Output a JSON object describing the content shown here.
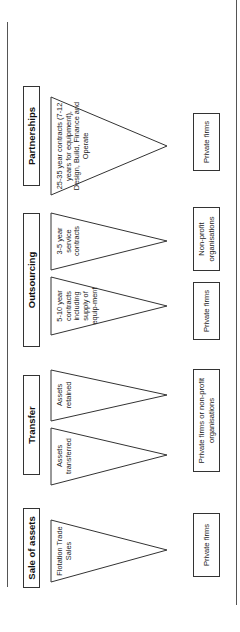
{
  "categories": [
    {
      "id": "partnerships",
      "header": "Partnerships",
      "options": [
        {
          "label": "25-35 year contracts (7-12 years for equipment), Design, Build, Finance and Operate"
        }
      ],
      "providers": [
        {
          "label": "Private firms"
        }
      ]
    },
    {
      "id": "outsourcing",
      "header": "Outsourcing",
      "options": [
        {
          "label": "3-5 year service contracts"
        },
        {
          "label": "5-10 year contracts including supply of equip-ment"
        }
      ],
      "providers": [
        {
          "label": "Non-profit organisations"
        },
        {
          "label": "Private firms"
        }
      ]
    },
    {
      "id": "transfer",
      "header": "Transfer",
      "options": [
        {
          "label": "Assets retained"
        },
        {
          "label": "Assets transferred"
        }
      ],
      "providers": [
        {
          "label": "Private firms or non-profit organisations"
        }
      ]
    },
    {
      "id": "sale-of-assets",
      "header": "Sale of assets",
      "options": [
        {
          "label": "Flotation Trade Sales"
        }
      ],
      "providers": [
        {
          "label": "Private firms"
        }
      ]
    }
  ],
  "orientation": "rotated-90-ccw"
}
